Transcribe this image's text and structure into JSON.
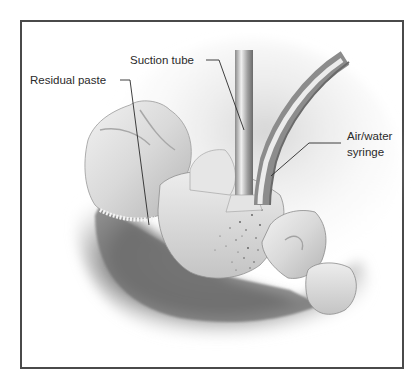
{
  "figure": {
    "type": "anatomical illustration",
    "labels": {
      "residual_paste": "Residual paste",
      "suction_tube": "Suction tube",
      "air_water_syringe_line1": "Air/water",
      "air_water_syringe_line2": "syringe"
    }
  },
  "colors": {
    "frame": "#4a4a4a",
    "leader_line": "#2a2a2a",
    "label_text": "#2a2a2a"
  }
}
